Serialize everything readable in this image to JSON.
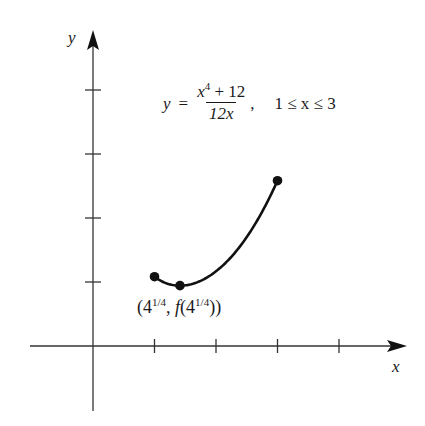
{
  "chart_data": {
    "type": "line",
    "title": "",
    "xlabel": "x",
    "ylabel": "y",
    "function": "y = (x^4 + 12) / (12x)",
    "domain": [
      1,
      3
    ],
    "x": [
      1.0,
      1.25,
      1.414,
      1.6,
      1.8,
      2.0,
      2.2,
      2.4,
      2.6,
      2.8,
      3.0
    ],
    "series": [
      {
        "name": "y = (x^4 + 12)/(12x)",
        "values": [
          1.083,
          0.963,
          0.943,
          0.966,
          1.042,
          1.167,
          1.342,
          1.569,
          1.849,
          2.186,
          2.583
        ]
      }
    ],
    "marked_points": [
      {
        "label": "left endpoint",
        "x": 1.0,
        "y": 1.083
      },
      {
        "label": "(4^{1/4}, f(4^{1/4}))",
        "x": 1.414,
        "y": 0.943
      },
      {
        "label": "right endpoint",
        "x": 3.0,
        "y": 2.583
      }
    ],
    "x_ticks": [
      1,
      2,
      3,
      4
    ],
    "y_ticks": [
      1,
      2,
      3,
      4
    ],
    "tick_labels_shown": false,
    "grid": false,
    "legend": "none",
    "annotations": [
      "y = (x^4 + 12)/(12x),  1 ≤ x ≤ 3",
      "(4^{1/4}, f(4^{1/4}))"
    ]
  },
  "equation": {
    "lhs": "y",
    "eq": "=",
    "num_base": "x",
    "num_exp": "4",
    "num_rest": " + 12",
    "den": "12x",
    "comma": ",",
    "range": "1 ≤ x ≤ 3"
  },
  "point_label": {
    "open": "(4",
    "exp1": "1/4",
    "mid": ", ",
    "f": "f",
    "open2": "(4",
    "exp2": "1/4",
    "close": "))"
  },
  "axes": {
    "x_label": "x",
    "y_label": "y"
  }
}
